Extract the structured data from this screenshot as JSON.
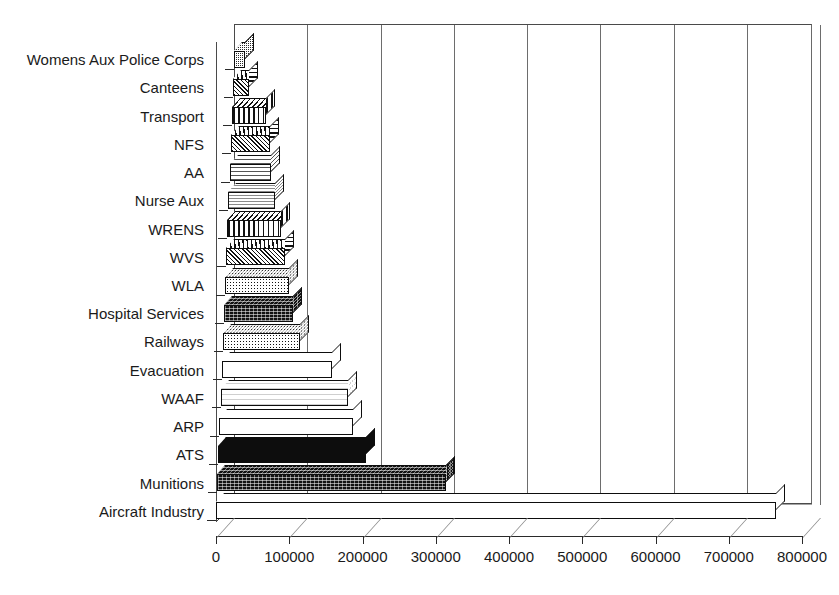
{
  "chart_data": {
    "type": "bar",
    "orientation": "horizontal",
    "title": "",
    "xlabel": "",
    "ylabel": "",
    "xlim": [
      0,
      800000
    ],
    "xticks": [
      0,
      100000,
      200000,
      300000,
      400000,
      500000,
      600000,
      700000,
      800000
    ],
    "xtick_labels": [
      "0",
      "100000",
      "200000",
      "300000",
      "400000",
      "500000",
      "600000",
      "700000",
      "800000"
    ],
    "grid": true,
    "grid_axis": "x",
    "legend": "none",
    "style": "3d-bar",
    "categories": [
      "Womens Aux Police Corps",
      "Canteens",
      "Transport",
      "NFS",
      "AA",
      "Nurse Aux",
      "WRENS",
      "WVS",
      "WLA",
      "Hospital Services",
      "Railways",
      "Evacuation",
      "WAAF",
      "ARP",
      "ATS",
      "Munitions",
      "Aircraft Industry"
    ],
    "values": [
      15000,
      22000,
      47000,
      54000,
      57000,
      63000,
      74000,
      80000,
      87000,
      95000,
      105000,
      150000,
      174000,
      182000,
      202000,
      312000,
      765000
    ],
    "bar_patterns": [
      "checker",
      "diag",
      "vert",
      "diag",
      "horiz",
      "fine",
      "vert",
      "diag",
      "dots",
      "dark",
      "dots",
      "white",
      "lgray",
      "white",
      "solid",
      "dark",
      "white"
    ]
  },
  "axis": {
    "x_tick_labels": [
      "0",
      "100000",
      "200000",
      "300000",
      "400000",
      "500000",
      "600000",
      "700000",
      "800000"
    ]
  }
}
